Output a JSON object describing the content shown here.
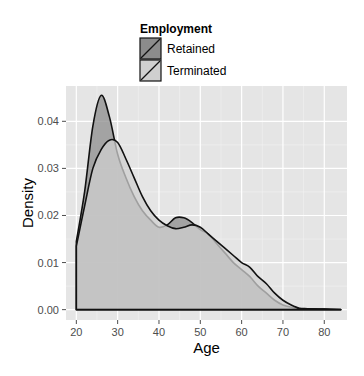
{
  "chart_data": {
    "type": "area",
    "subtype": "density",
    "title": "",
    "xlabel": "Age",
    "ylabel": "Density",
    "xlim": [
      17.5,
      85.5
    ],
    "ylim": [
      -0.0022,
      0.0475
    ],
    "xticks": [
      20,
      30,
      40,
      50,
      60,
      70,
      80
    ],
    "xtick_labels": [
      "20",
      "30",
      "40",
      "50",
      "60",
      "70",
      "80"
    ],
    "yticks": [
      0.0,
      0.01,
      0.02,
      0.03,
      0.04
    ],
    "ytick_labels": [
      "0.00",
      "0.01",
      "0.02",
      "0.03",
      "0.04"
    ],
    "grid": true,
    "legend": {
      "title": "Employment",
      "placement": "top",
      "entries": [
        "Retained",
        "Terminated"
      ]
    },
    "x": [
      20,
      22,
      24,
      26,
      28,
      30,
      32,
      34,
      36,
      38,
      40,
      42,
      44,
      46,
      48,
      50,
      52,
      54,
      56,
      58,
      60,
      62,
      64,
      66,
      68,
      70,
      72,
      74,
      76,
      80,
      84
    ],
    "series": [
      {
        "name": "Retained",
        "color": "#8c8c8c",
        "values": [
          0.0145,
          0.025,
          0.039,
          0.0455,
          0.041,
          0.033,
          0.028,
          0.024,
          0.021,
          0.019,
          0.0175,
          0.018,
          0.0195,
          0.0195,
          0.0185,
          0.017,
          0.016,
          0.014,
          0.012,
          0.01,
          0.0085,
          0.007,
          0.005,
          0.0035,
          0.002,
          0.001,
          0.0005,
          0.0002,
          0.0002,
          0.0001,
          0.0
        ]
      },
      {
        "name": "Terminated",
        "color": "#cfcfcf",
        "values": [
          0.0135,
          0.022,
          0.03,
          0.034,
          0.036,
          0.0355,
          0.032,
          0.028,
          0.024,
          0.021,
          0.019,
          0.0178,
          0.0172,
          0.0175,
          0.018,
          0.0175,
          0.016,
          0.0145,
          0.013,
          0.0115,
          0.01,
          0.009,
          0.007,
          0.0055,
          0.0035,
          0.002,
          0.001,
          0.0003,
          0.0002,
          0.0001,
          0.0
        ]
      }
    ]
  }
}
